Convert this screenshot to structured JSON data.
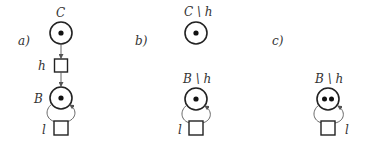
{
  "diagram": {
    "type": "petri-net-figure",
    "panels": [
      {
        "id": "a",
        "label": "a)",
        "places": [
          {
            "name": "C",
            "label": "C",
            "tokens": 1
          },
          {
            "name": "B",
            "label": "B",
            "tokens": 1
          }
        ],
        "transitions": [
          {
            "name": "h",
            "label": "h"
          },
          {
            "name": "l",
            "label": "l"
          }
        ],
        "arcs": [
          {
            "from": "C",
            "to": "h"
          },
          {
            "from": "h",
            "to": "B"
          },
          {
            "from": "B",
            "to": "l"
          },
          {
            "from": "l",
            "to": "B"
          }
        ]
      },
      {
        "id": "b",
        "label": "b)",
        "places": [
          {
            "name": "C\\h",
            "label": "C \\ h",
            "tokens": 1
          },
          {
            "name": "B\\h",
            "label": "B \\ h",
            "tokens": 1
          }
        ],
        "transitions": [
          {
            "name": "l",
            "label": "l"
          }
        ],
        "arcs": [
          {
            "from": "B\\h",
            "to": "l"
          },
          {
            "from": "l",
            "to": "B\\h"
          }
        ]
      },
      {
        "id": "c",
        "label": "c)",
        "places": [
          {
            "name": "B\\h",
            "label": "B \\ h",
            "tokens": 2
          }
        ],
        "transitions": [
          {
            "name": "l",
            "label": "l"
          }
        ],
        "arcs": [
          {
            "from": "B\\h",
            "to": "l"
          },
          {
            "from": "l",
            "to": "B\\h"
          }
        ]
      }
    ]
  },
  "labels": {
    "a_panel": "a)",
    "b_panel": "b)",
    "c_panel": "c)",
    "a_C": "C",
    "a_h": "h",
    "a_B": "B",
    "a_l": "l",
    "b_C": "C \\ h",
    "b_B": "B \\ h",
    "b_l": "l",
    "c_B": "B \\ h",
    "c_l": "l"
  },
  "colors": {
    "stroke": "#222222",
    "arc": "#555555",
    "token": "#111111",
    "background": "#ffffff"
  }
}
